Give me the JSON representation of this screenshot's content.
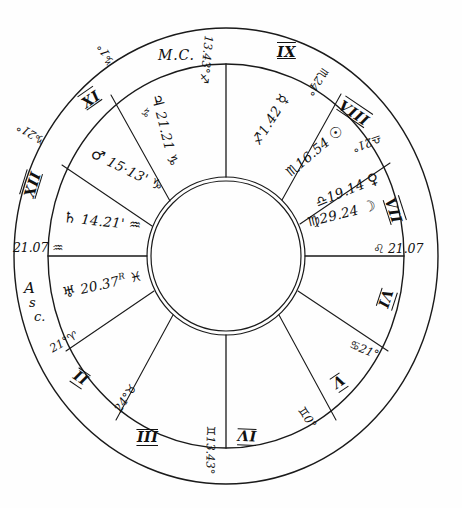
{
  "chart": {
    "style": "handwritten pen-and-ink horoscope wheel",
    "ink_color": "#111111",
    "paper_color": "#fefefe"
  },
  "angles": {
    "mc_label": "M.C.",
    "asc_label_line1": "A",
    "asc_label_line2": "s",
    "asc_label_line3": "c.",
    "mc_degree": "13.43°",
    "mc_sign_glyph": "♐",
    "ic_degree": "13.43°",
    "ic_sign_glyph": "♊",
    "asc_degree": "21.07",
    "asc_sign_glyph": "♒",
    "dsc_degree": "21.07",
    "dsc_sign_glyph": "♌"
  },
  "houses": [
    {
      "numeral": "IX",
      "index": 9
    },
    {
      "numeral": "VIII",
      "index": 8
    },
    {
      "numeral": "VII",
      "index": 7
    },
    {
      "numeral": "VI",
      "index": 6
    },
    {
      "numeral": "V",
      "index": 5
    },
    {
      "numeral": "IV",
      "index": 4
    },
    {
      "numeral": "III",
      "index": 3
    },
    {
      "numeral": "II",
      "index": 2
    },
    {
      "numeral": "XII",
      "index": 12
    },
    {
      "numeral": "XI",
      "index": 11
    }
  ],
  "cusps": [
    {
      "id": "cusp-x-xi",
      "degree": "1°",
      "sign_glyph": "♑",
      "label": "1° Capricorn"
    },
    {
      "id": "cusp-xi-xii",
      "degree": "21°",
      "sign_glyph": "♑",
      "label": "21° Capricorn"
    },
    {
      "id": "cusp-asc",
      "degree": "21.07",
      "sign_glyph": "♒",
      "label": "21°07' Aquarius"
    },
    {
      "id": "cusp-ii",
      "degree": "21°",
      "sign_glyph": "♈",
      "label": "21° Aries"
    },
    {
      "id": "cusp-iii",
      "degree": "24°",
      "sign_glyph": "♉",
      "label": "24° Taurus"
    },
    {
      "id": "cusp-ic",
      "degree": "13.43°",
      "sign_glyph": "♊",
      "label": "13°43' Gemini"
    },
    {
      "id": "cusp-v",
      "degree": "0°",
      "sign_glyph": "♊",
      "label": "0° Gemini"
    },
    {
      "id": "cusp-vi",
      "degree": "21°",
      "sign_glyph": "♋",
      "label": "21° Cancer"
    },
    {
      "id": "cusp-dsc",
      "degree": "21.07",
      "sign_glyph": "♌",
      "label": "21°07' Leo"
    },
    {
      "id": "cusp-viii",
      "degree": "21°",
      "sign_glyph": "♎",
      "label": "21° Libra"
    },
    {
      "id": "cusp-ix",
      "degree": "24°",
      "sign_glyph": "♏",
      "label": "24° Scorpio"
    },
    {
      "id": "cusp-mc",
      "degree": "13.43°",
      "sign_glyph": "♐",
      "label": "13°43' Sagittarius"
    }
  ],
  "planets": [
    {
      "id": "jupiter",
      "glyph": "♃",
      "name": "Jupiter",
      "degree": "21.21",
      "text": "21.21",
      "sign_glyph": "♑",
      "sign": "Capricorn",
      "retrograde": false,
      "full": "♃ 21°21' ♑"
    },
    {
      "id": "mars",
      "glyph": "♂",
      "name": "Mars",
      "degree": "15.13",
      "text": "15·13'",
      "sign_glyph": "♑",
      "sign": "Capricorn",
      "retrograde": false,
      "full": "♂ 15°13' ♑"
    },
    {
      "id": "saturn",
      "glyph": "♄",
      "name": "Saturn",
      "degree": "14.21",
      "text": "14.21'",
      "sign_glyph": "♒",
      "sign": "Aquarius",
      "retrograde": false,
      "full": "♄ 14°21' ♒"
    },
    {
      "id": "uranus",
      "glyph": "♅",
      "name": "Uranus",
      "degree": "20.37",
      "text": "20.37",
      "sign_glyph": "♓",
      "sign": "Pisces",
      "retrograde": true,
      "retro_mark": "R",
      "full": "♅ 20°37' R ♓"
    },
    {
      "id": "mercury",
      "glyph": "☿",
      "name": "Mercury",
      "degree": "1.42",
      "text": "1.42",
      "sign_glyph": "♐",
      "sign": "Sagittarius",
      "retrograde": false,
      "full": "♐ 1°42' ☿"
    },
    {
      "id": "sun",
      "glyph": "☉",
      "name": "Sun",
      "degree": "16.54",
      "text": "16.54",
      "sign_glyph": "♏",
      "sign": "Scorpio",
      "retrograde": false,
      "full": "♏ 16°54' ☉"
    },
    {
      "id": "venus",
      "glyph": "♀",
      "name": "Venus",
      "degree": "19.14",
      "text": "19.14",
      "sign_glyph": "♎",
      "sign": "Libra",
      "retrograde": false,
      "full": "♎ 19°14' ♀"
    },
    {
      "id": "moon",
      "glyph": "☽",
      "name": "Moon",
      "degree": "29.24",
      "text": "29.24",
      "sign_glyph": "♍",
      "sign": "Virgo",
      "retrograde": false,
      "full": "♍ 29°24' ☽"
    }
  ]
}
